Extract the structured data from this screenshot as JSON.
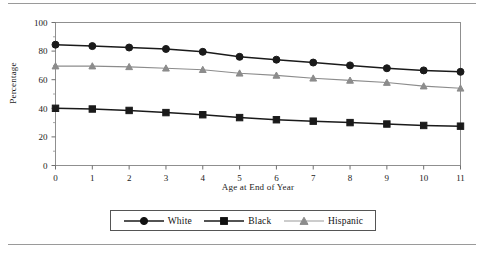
{
  "chart_data": {
    "type": "line",
    "title": "",
    "xlabel": "Age at End of Year",
    "ylabel": "Percentage",
    "x": [
      0,
      1,
      2,
      3,
      4,
      5,
      6,
      7,
      8,
      9,
      10,
      11
    ],
    "xticklabels": [
      "0",
      "1",
      "2",
      "3",
      "4",
      "5",
      "6",
      "7",
      "8",
      "9",
      "10",
      "11"
    ],
    "yticklabels": [
      "0",
      "20",
      "40",
      "60",
      "80",
      "100"
    ],
    "yticks": [
      0,
      20,
      40,
      60,
      80,
      100
    ],
    "xlim": [
      0,
      11
    ],
    "ylim": [
      0,
      100
    ],
    "grid": false,
    "legend_position": "bottom",
    "series": [
      {
        "name": "White",
        "marker": "circle",
        "color": "#1a1a1a",
        "values": [
          84.5,
          83.5,
          82.5,
          81.5,
          79.5,
          76.0,
          74.0,
          72.0,
          70.0,
          68.0,
          66.5,
          65.5
        ]
      },
      {
        "name": "Black",
        "marker": "square",
        "color": "#1a1a1a",
        "values": [
          40.0,
          39.5,
          38.5,
          37.0,
          35.5,
          33.5,
          32.0,
          31.0,
          30.0,
          29.0,
          28.0,
          27.5
        ]
      },
      {
        "name": "Hispanic",
        "marker": "triangle",
        "color": "#8c8c8c",
        "values": [
          69.5,
          69.5,
          69.0,
          68.0,
          67.0,
          64.5,
          63.0,
          61.0,
          59.5,
          58.0,
          55.5,
          54.0
        ]
      }
    ]
  },
  "legend": {
    "items": [
      {
        "label": "White"
      },
      {
        "label": "Black"
      },
      {
        "label": "Hispanic"
      }
    ]
  },
  "decorations": {
    "top_rule": "horizontal-rule",
    "bottom_rule": "horizontal-rule"
  }
}
